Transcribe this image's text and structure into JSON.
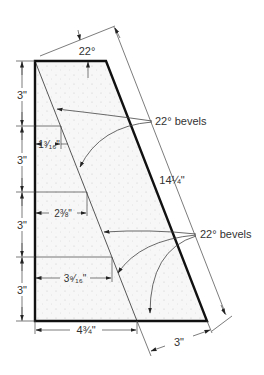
{
  "diagram": {
    "colors": {
      "outline": "#111111",
      "thin_line": "#444444",
      "text": "#333333",
      "fill": "#f6f6f6",
      "stipple": "#c8c8c8"
    },
    "labels": {
      "top_angle": "22°",
      "upper_bevels": "22° bevels",
      "lower_bevels": "22° bevels",
      "slant_length": "14¼\"",
      "bottom_width": "4¾\"",
      "bottom_slant_width": "3\"",
      "height_1": "3\"",
      "height_2": "3\"",
      "height_3": "3\"",
      "height_4": "3\"",
      "offset_1": "1³⁄₁₆\"",
      "offset_2": "2⅜\"",
      "offset_3": "3⁹⁄₁₆\""
    }
  }
}
